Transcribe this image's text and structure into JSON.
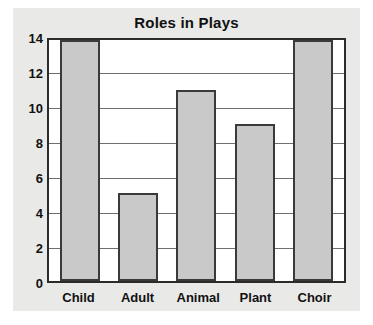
{
  "figure": {
    "background_color": "#e9e9e7",
    "plot_background_color": "#ffffff",
    "frame_color": "#2b2b2b"
  },
  "chart_data": {
    "type": "bar",
    "title": "Roles in Plays",
    "xlabel": "",
    "ylabel": "",
    "categories": [
      "Child",
      "Adult",
      "Animal",
      "Plant",
      "Choir"
    ],
    "values": [
      14,
      5.1,
      11.1,
      9.1,
      14
    ],
    "ylim": [
      0,
      14
    ],
    "yticks": [
      0,
      2,
      4,
      6,
      8,
      10,
      12,
      14
    ],
    "ytick_labels": [
      "0",
      "2",
      "4",
      "6",
      "8",
      "10",
      "12",
      "14"
    ],
    "grid": true,
    "grid_axis": "y",
    "legend": false,
    "bar_fill_color": "#c9c9c9",
    "bar_edge_color": "#3a3a3a"
  }
}
